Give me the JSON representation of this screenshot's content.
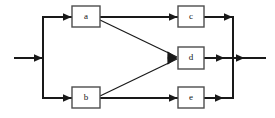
{
  "diagram": {
    "type": "block-flow-diagram",
    "background_color": "#ffffff",
    "line_color": "#191919",
    "box_stroke_color": "#4d4d4d",
    "box_fill_color": "#ffffff",
    "label_color": "#141414",
    "nodes": [
      {
        "id": "a",
        "label": "a",
        "x": 72,
        "y": 6,
        "w": 28,
        "h": 21
      },
      {
        "id": "b",
        "label": "b",
        "x": 72,
        "y": 87,
        "w": 28,
        "h": 21
      },
      {
        "id": "c",
        "label": "c",
        "x": 178,
        "y": 6,
        "w": 26,
        "h": 21
      },
      {
        "id": "d",
        "label": "d",
        "x": 178,
        "y": 47,
        "w": 26,
        "h": 22
      },
      {
        "id": "e",
        "label": "e",
        "x": 178,
        "y": 87,
        "w": 26,
        "h": 21
      }
    ],
    "edges": [
      {
        "from": "input",
        "to": "split-bus",
        "kind": "straight",
        "arrow": true
      },
      {
        "from": "split-bus",
        "to": "a",
        "kind": "straight",
        "arrow": true
      },
      {
        "from": "split-bus",
        "to": "b",
        "kind": "straight",
        "arrow": true
      },
      {
        "from": "a",
        "to": "c",
        "kind": "straight",
        "arrow": true
      },
      {
        "from": "a",
        "to": "d",
        "kind": "diagonal",
        "arrow": true
      },
      {
        "from": "b",
        "to": "d",
        "kind": "diagonal",
        "arrow": true
      },
      {
        "from": "b",
        "to": "e",
        "kind": "straight",
        "arrow": true
      },
      {
        "from": "c",
        "to": "merge-bus",
        "kind": "straight",
        "arrow": true
      },
      {
        "from": "d",
        "to": "merge-bus",
        "kind": "straight",
        "arrow": true
      },
      {
        "from": "e",
        "to": "merge-bus",
        "kind": "straight",
        "arrow": true
      },
      {
        "from": "merge-bus",
        "to": "output",
        "kind": "straight",
        "arrow": true
      }
    ],
    "buses": [
      {
        "id": "split-bus",
        "orientation": "vertical",
        "x": 43,
        "y1": 17,
        "y2": 98
      },
      {
        "id": "merge-bus",
        "orientation": "vertical",
        "x": 233,
        "y1": 17,
        "y2": 98
      }
    ],
    "terminals": {
      "input": {
        "x1": 14,
        "x2": 43,
        "y": 58,
        "label": ""
      },
      "output": {
        "x1": 233,
        "x2": 266,
        "y": 58,
        "label": ""
      }
    }
  }
}
